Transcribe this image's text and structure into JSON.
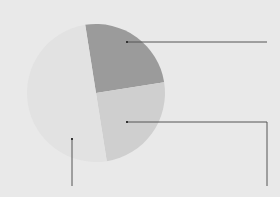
{
  "chart_data": {
    "type": "pie",
    "title": "",
    "categories": [
      "Segment A",
      "Segment B",
      "Segment C"
    ],
    "values": [
      25,
      25,
      50
    ],
    "colors": [
      "#9b9b9b",
      "#cfcfcf",
      "#e2e2e2"
    ],
    "start_angle_deg": -9,
    "labels_visible": false,
    "legend": "none",
    "callouts": [
      {
        "segment": "Segment A",
        "anchor": [
          127,
          42
        ],
        "path": [
          [
            127,
            42
          ],
          [
            267,
            42
          ]
        ]
      },
      {
        "segment": "Segment B",
        "anchor": [
          127,
          122
        ],
        "path": [
          [
            127,
            122
          ],
          [
            267,
            122
          ],
          [
            267,
            186
          ]
        ]
      },
      {
        "segment": "Segment C",
        "anchor": [
          72,
          139
        ],
        "path": [
          [
            72,
            139
          ],
          [
            72,
            186
          ]
        ]
      }
    ]
  },
  "colors": {
    "background": "#e9e9e9",
    "leader_line": "#555555"
  }
}
